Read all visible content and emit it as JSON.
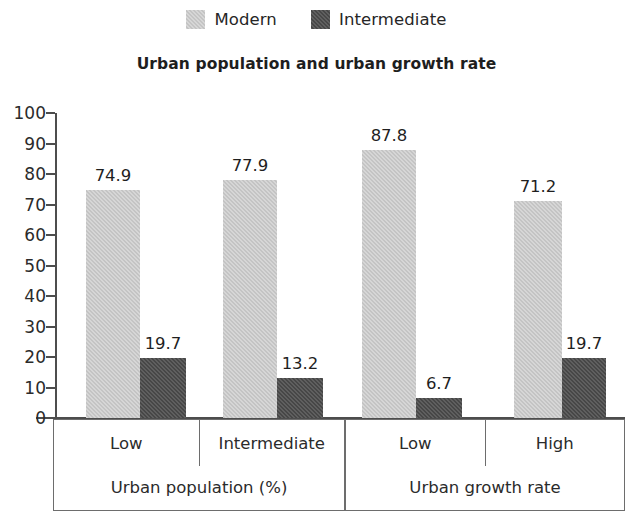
{
  "legend": {
    "entries": [
      {
        "label": "Modern",
        "color": "#c4c4c4",
        "swatch_name": "legend-swatch-modern"
      },
      {
        "label": "Intermediate",
        "color": "#474747",
        "swatch_name": "legend-swatch-intermediate"
      }
    ]
  },
  "chart_data": {
    "type": "bar",
    "title": "Urban population and urban growth rate",
    "xlabel": "",
    "ylabel": "",
    "ylim": [
      0,
      100
    ],
    "yticks": [
      0,
      10,
      20,
      30,
      40,
      50,
      60,
      70,
      80,
      90,
      100
    ],
    "grid": false,
    "legend_position": "top-center",
    "series": [
      {
        "name": "Modern",
        "color": "#c4c4c4",
        "values": [
          74.9,
          77.9,
          87.8,
          71.2
        ]
      },
      {
        "name": "Intermediate",
        "color": "#474747",
        "values": [
          19.7,
          13.2,
          6.7,
          19.7
        ]
      }
    ],
    "categories": [
      "Low",
      "Intermediate",
      "Low",
      "High"
    ],
    "groups": [
      {
        "label": "Urban population (%)",
        "categories": [
          "Low",
          "Intermediate"
        ]
      },
      {
        "label": "Urban growth rate",
        "categories": [
          "Low",
          "High"
        ]
      }
    ],
    "bar_labels": [
      {
        "text": "74.9",
        "series": "Modern",
        "category_index": 0
      },
      {
        "text": "19.7",
        "series": "Intermediate",
        "category_index": 0
      },
      {
        "text": "77.9",
        "series": "Modern",
        "category_index": 1
      },
      {
        "text": "13.2",
        "series": "Intermediate",
        "category_index": 1
      },
      {
        "text": "87.8",
        "series": "Modern",
        "category_index": 2
      },
      {
        "text": "6.7",
        "series": "Intermediate",
        "category_index": 2
      },
      {
        "text": "71.2",
        "series": "Modern",
        "category_index": 3
      },
      {
        "text": "19.7",
        "series": "Intermediate",
        "category_index": 3
      }
    ]
  },
  "axis": {
    "tick_labels": [
      "100",
      "90",
      "80",
      "70",
      "60",
      "50",
      "40",
      "30",
      "20",
      "10",
      "0"
    ]
  }
}
